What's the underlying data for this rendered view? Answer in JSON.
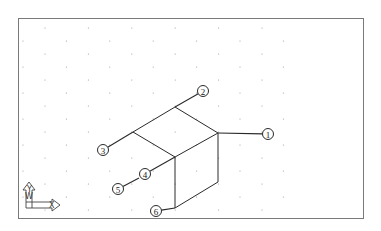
{
  "drawing": {
    "type": "isometric box with numbered callouts",
    "frame": {
      "x": 18,
      "y": 18,
      "w": 345,
      "h": 200,
      "color": "#7a7a7a"
    },
    "grid": {
      "style": "isometric dots",
      "color": "#9a9a9a"
    },
    "line_color": "#2a2a2a",
    "callouts": [
      {
        "label": "1",
        "cx": 268,
        "cy": 134,
        "target": [
          218,
          133
        ]
      },
      {
        "label": "2",
        "cx": 203,
        "cy": 91,
        "target": [
          175,
          107
        ]
      },
      {
        "label": "3",
        "cx": 103,
        "cy": 150,
        "target": [
          133,
          132
        ]
      },
      {
        "label": "4",
        "cx": 145,
        "cy": 174,
        "target": [
          175,
          157
        ]
      },
      {
        "label": "5",
        "cx": 118,
        "cy": 189,
        "target": [
          139,
          178
        ]
      },
      {
        "label": "6",
        "cx": 156,
        "cy": 211,
        "target": [
          175,
          208
        ]
      }
    ]
  },
  "ucs_icon": {
    "x_label": "X",
    "y_label": "Y",
    "w_label": "W"
  }
}
